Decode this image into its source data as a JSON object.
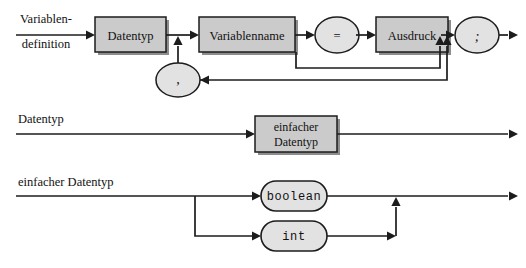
{
  "document": {
    "kind": "syntax-railroad-diagram",
    "language": "de",
    "background_color": "#ffffff",
    "line_color": "#1c1c1c",
    "box_fill": "#cbcbcb",
    "terminal_fill": "#e2e2e2"
  },
  "rules": [
    {
      "id": "variablendefinition",
      "label_line1": "Variablen-",
      "label_line2": "definition",
      "nodes": [
        {
          "id": "datentyp",
          "text": "Datentyp",
          "shape": "box"
        },
        {
          "id": "variablenname",
          "text": "Variablenname",
          "shape": "box"
        },
        {
          "id": "equals",
          "text": "=",
          "shape": "ellipse"
        },
        {
          "id": "ausdruck",
          "text": "Ausdruck",
          "shape": "box"
        },
        {
          "id": "semicolon",
          "text": ";",
          "shape": "ellipse"
        },
        {
          "id": "comma",
          "text": ",",
          "shape": "ellipse"
        }
      ]
    },
    {
      "id": "datentyp",
      "label": "Datentyp",
      "nodes": [
        {
          "id": "einfacher-datentyp",
          "text_line1": "einfacher",
          "text_line2": "Datentyp",
          "shape": "box"
        }
      ]
    },
    {
      "id": "einfacher-datentyp",
      "label": "einfacher Datentyp",
      "nodes": [
        {
          "id": "boolean",
          "text": "boolean",
          "shape": "stadium"
        },
        {
          "id": "int",
          "text": "int",
          "shape": "stadium"
        }
      ]
    }
  ]
}
